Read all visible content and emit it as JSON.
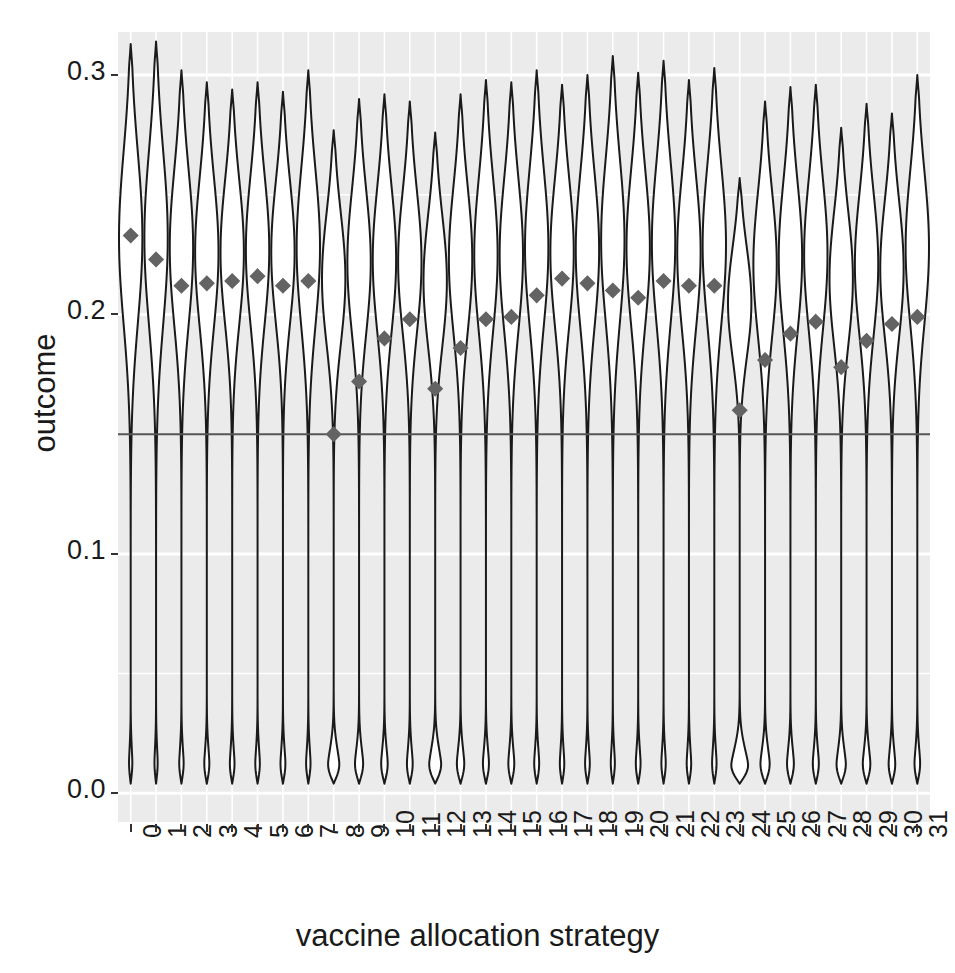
{
  "chart_data": {
    "type": "violin",
    "title": "",
    "subtitle": "",
    "xlabel": "vaccine allocation strategy",
    "ylabel": "outcome",
    "xlim": [
      -0.5,
      31.5
    ],
    "ylim": [
      -0.012,
      0.318
    ],
    "grid": true,
    "grid_color": "#ffffff",
    "panel_background": "#ebebeb",
    "legend": null,
    "legend_position": "none",
    "ytick_values": [
      0.0,
      0.1,
      0.2,
      0.3
    ],
    "ytick_labels": [
      "0.0",
      "0.1",
      "0.2",
      "0.3"
    ],
    "categories": [
      "0",
      "1",
      "2",
      "3",
      "4",
      "5",
      "6",
      "7",
      "8",
      "9",
      "10",
      "11",
      "12",
      "13",
      "14",
      "15",
      "16",
      "17",
      "18",
      "19",
      "20",
      "21",
      "22",
      "23",
      "24",
      "25",
      "26",
      "27",
      "28",
      "29",
      "30",
      "31"
    ],
    "reference_line": {
      "y": 0.15,
      "color": "#555555",
      "width": 2,
      "orientation": "horizontal"
    },
    "mean_marker": {
      "shape": "diamond",
      "color": "#636363",
      "size": 11,
      "label": "mean outcome"
    },
    "violin": {
      "fill": "#ffffff",
      "outline": "#1a1a1a",
      "outline_width": 2,
      "bimodal": true,
      "note": "each violin is bimodal: a dense narrow lower mode near 0.005 and a broad upper mode spanning roughly 0.15-0.30"
    },
    "series": [
      {
        "name": "mean outcome",
        "values": [
          0.233,
          0.223,
          0.212,
          0.213,
          0.214,
          0.216,
          0.212,
          0.214,
          0.15,
          0.172,
          0.19,
          0.198,
          0.169,
          0.186,
          0.198,
          0.199,
          0.208,
          0.215,
          0.213,
          0.21,
          0.207,
          0.214,
          0.212,
          0.212,
          0.16,
          0.181,
          0.192,
          0.197,
          0.178,
          0.189,
          0.196,
          0.199
        ]
      },
      {
        "name": "violin upper peak (max extent)",
        "values": [
          0.313,
          0.314,
          0.302,
          0.297,
          0.294,
          0.297,
          0.293,
          0.302,
          0.277,
          0.29,
          0.292,
          0.289,
          0.276,
          0.292,
          0.298,
          0.297,
          0.302,
          0.296,
          0.3,
          0.308,
          0.301,
          0.306,
          0.298,
          0.303,
          0.257,
          0.289,
          0.295,
          0.296,
          0.278,
          0.288,
          0.284,
          0.3
        ]
      },
      {
        "name": "violin lower extent (min)",
        "values": [
          0.004,
          0.004,
          0.004,
          0.004,
          0.004,
          0.004,
          0.004,
          0.004,
          0.004,
          0.004,
          0.004,
          0.004,
          0.004,
          0.004,
          0.004,
          0.004,
          0.004,
          0.004,
          0.004,
          0.004,
          0.004,
          0.004,
          0.004,
          0.004,
          0.004,
          0.004,
          0.004,
          0.004,
          0.004,
          0.004,
          0.004,
          0.004
        ]
      },
      {
        "name": "upper mode centre (widest point of upper lobe)",
        "values": [
          0.232,
          0.232,
          0.228,
          0.226,
          0.226,
          0.227,
          0.226,
          0.228,
          0.215,
          0.222,
          0.223,
          0.222,
          0.214,
          0.223,
          0.225,
          0.225,
          0.228,
          0.226,
          0.227,
          0.231,
          0.228,
          0.23,
          0.226,
          0.229,
          0.205,
          0.221,
          0.224,
          0.225,
          0.215,
          0.221,
          0.219,
          0.228
        ]
      },
      {
        "name": "upper mode relative width (0-1)",
        "values": [
          0.95,
          0.98,
          0.9,
          0.87,
          0.86,
          0.88,
          0.86,
          0.9,
          0.62,
          0.74,
          0.8,
          0.84,
          0.6,
          0.76,
          0.83,
          0.84,
          0.88,
          0.9,
          0.89,
          0.92,
          0.88,
          0.91,
          0.89,
          0.89,
          0.5,
          0.7,
          0.79,
          0.83,
          0.66,
          0.75,
          0.8,
          0.85
        ]
      },
      {
        "name": "lower mode relative width (0-1)",
        "values": [
          0.16,
          0.16,
          0.2,
          0.22,
          0.2,
          0.2,
          0.21,
          0.2,
          0.34,
          0.3,
          0.26,
          0.24,
          0.35,
          0.28,
          0.25,
          0.25,
          0.22,
          0.2,
          0.21,
          0.19,
          0.21,
          0.2,
          0.2,
          0.2,
          0.4,
          0.32,
          0.27,
          0.25,
          0.3,
          0.28,
          0.26,
          0.24
        ]
      }
    ]
  },
  "axes": {
    "y_title": "outcome",
    "x_title": "vaccine allocation strategy",
    "y_ticks": [
      "0.0",
      "0.1",
      "0.2",
      "0.3"
    ],
    "x_ticks": [
      "0",
      "1",
      "2",
      "3",
      "4",
      "5",
      "6",
      "7",
      "8",
      "9",
      "10",
      "11",
      "12",
      "13",
      "14",
      "15",
      "16",
      "17",
      "18",
      "19",
      "20",
      "21",
      "22",
      "23",
      "24",
      "25",
      "26",
      "27",
      "28",
      "29",
      "30",
      "31"
    ]
  }
}
